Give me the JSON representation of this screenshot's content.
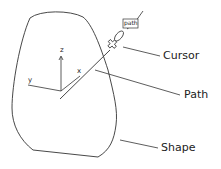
{
  "diagram": {
    "labels": {
      "cursor": "Cursor",
      "path": "Path",
      "shape": "Shape"
    },
    "tag": "path",
    "axes": {
      "x": "x",
      "y": "y",
      "z": "z"
    },
    "stroke_color": "#333333"
  }
}
